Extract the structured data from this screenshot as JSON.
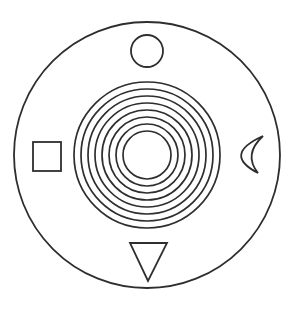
{
  "diagram": {
    "stroke_color": "#2e2e2e",
    "background_color": "#ffffff",
    "outer_circle": {
      "cx": 147,
      "cy": 155,
      "r": 133
    },
    "concentric_rings": {
      "count": 8,
      "cx": 147,
      "cy": 155,
      "radii": [
        73,
        66,
        59,
        52,
        45,
        38,
        31,
        24
      ]
    },
    "symbols": [
      {
        "name": "circle",
        "position": "top",
        "cx": 147,
        "cy": 51,
        "r": 16
      },
      {
        "name": "square",
        "position": "left",
        "x": 33,
        "y": 142,
        "width": 28,
        "height": 29
      },
      {
        "name": "crescent-moon",
        "position": "right",
        "top_tip": [
          263,
          136
        ],
        "bottom_tip": [
          258,
          173
        ],
        "outer_left_x": 236,
        "inner_left_x": 249
      },
      {
        "name": "triangle-down",
        "position": "bottom",
        "points": [
          [
            130,
            243
          ],
          [
            167,
            243
          ],
          [
            148,
            281
          ]
        ]
      }
    ]
  }
}
